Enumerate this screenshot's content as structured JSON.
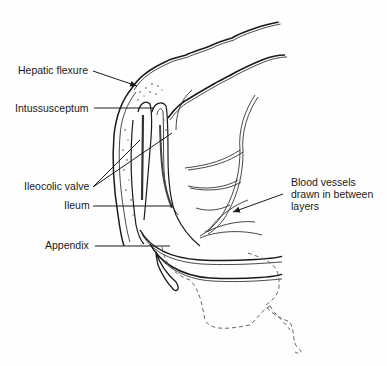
{
  "diagram": {
    "labels": {
      "hepatic_flexure": "Hepatic flexure",
      "intussusceptum": "Intussusceptum",
      "ileocolic_valve": "Ileocolic valve",
      "ileum": "Ileum",
      "appendix": "Appendix",
      "blood_vessels_line1": "Blood vessels",
      "blood_vessels_line2": "drawn in between",
      "blood_vessels_line3": "layers"
    },
    "colors": {
      "ink": "#1a1a1a",
      "background": "#fefefe",
      "dashed": "#555555"
    }
  }
}
